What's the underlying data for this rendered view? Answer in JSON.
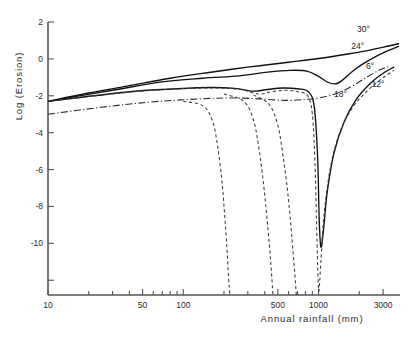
{
  "chart_data": {
    "type": "line",
    "title": "",
    "xlabel": "Annual rainfall (mm)",
    "ylabel": "Log (Erosion)",
    "xscale": "log",
    "yscale": "linear",
    "xlim": [
      10,
      4000
    ],
    "ylim": [
      -12.8,
      2
    ],
    "grid": false,
    "legend_position": "inline-curve-labels",
    "x_ticks_labeled": [
      10,
      50,
      100,
      500,
      1000,
      3000
    ],
    "x_tick_labels": [
      "10",
      "50",
      "100",
      "500",
      "1000",
      "3000"
    ],
    "x_ticks_minor": [
      20,
      30,
      40,
      60,
      70,
      80,
      90,
      200,
      300,
      400,
      600,
      700,
      800,
      900,
      2000
    ],
    "y_ticks_labeled": [
      2,
      0,
      -2,
      -4,
      -6,
      -8,
      -10
    ],
    "y_tick_labels": [
      "2",
      "0",
      "-2",
      "-4",
      "-6",
      "-8",
      "-10"
    ],
    "y_ticks_minor": [
      -12
    ],
    "series": [
      {
        "name": "30",
        "label": "30°",
        "style": "solid",
        "label_x": 2150,
        "label_y": 1.45,
        "points": [
          [
            10,
            -2.3
          ],
          [
            20,
            -1.85
          ],
          [
            40,
            -1.45
          ],
          [
            80,
            -1.05
          ],
          [
            150,
            -0.75
          ],
          [
            300,
            -0.45
          ],
          [
            600,
            -0.18
          ],
          [
            1000,
            0.02
          ],
          [
            1600,
            0.25
          ],
          [
            2400,
            0.48
          ],
          [
            3300,
            0.7
          ],
          [
            3900,
            0.82
          ]
        ]
      },
      {
        "name": "24",
        "label": "24°",
        "style": "solid",
        "label_x": 1950,
        "label_y": 0.55,
        "points": [
          [
            10,
            -2.3
          ],
          [
            30,
            -1.7
          ],
          [
            70,
            -1.25
          ],
          [
            140,
            -1.05
          ],
          [
            260,
            -0.92
          ],
          [
            420,
            -0.72
          ],
          [
            620,
            -0.62
          ],
          [
            820,
            -0.66
          ],
          [
            1000,
            -0.95
          ],
          [
            1180,
            -1.28
          ],
          [
            1350,
            -1.35
          ],
          [
            1500,
            -1.15
          ],
          [
            1750,
            -0.72
          ],
          [
            2100,
            -0.3
          ],
          [
            2600,
            0.1
          ],
          [
            3200,
            0.42
          ],
          [
            3900,
            0.68
          ]
        ]
      },
      {
        "name": "18",
        "label": "18°",
        "style": "solid",
        "label_x": 1450,
        "label_y": -2.05,
        "points": [
          [
            10,
            -2.3
          ],
          [
            40,
            -1.78
          ],
          [
            90,
            -1.62
          ],
          [
            160,
            -1.55
          ],
          [
            240,
            -1.6
          ],
          [
            330,
            -1.75
          ],
          [
            420,
            -1.66
          ],
          [
            540,
            -1.58
          ],
          [
            700,
            -1.62
          ],
          [
            840,
            -1.78
          ],
          [
            930,
            -2.6
          ],
          [
            985,
            -5.4
          ],
          [
            1010,
            -8.6
          ],
          [
            1040,
            -10.2
          ],
          [
            1090,
            -9.2
          ],
          [
            1160,
            -7.2
          ],
          [
            1300,
            -5.1
          ],
          [
            1550,
            -3.4
          ],
          [
            1900,
            -2.2
          ],
          [
            2400,
            -1.35
          ],
          [
            3000,
            -0.78
          ],
          [
            3600,
            -0.45
          ]
        ]
      },
      {
        "name": "12",
        "label": "12°",
        "style": "dashed",
        "label_x": 2750,
        "label_y": -1.55,
        "points": [
          [
            10,
            -2.3
          ],
          [
            40,
            -1.8
          ],
          [
            95,
            -1.62
          ],
          [
            170,
            -1.58
          ],
          [
            260,
            -1.65
          ],
          [
            360,
            -1.9
          ],
          [
            450,
            -1.78
          ],
          [
            570,
            -1.7
          ],
          [
            700,
            -1.78
          ],
          [
            830,
            -2.0
          ],
          [
            900,
            -3.0
          ],
          [
            940,
            -5.6
          ],
          [
            965,
            -8.6
          ],
          [
            985,
            -11.2
          ],
          [
            1005,
            -12.6
          ],
          [
            1040,
            -11.0
          ],
          [
            1100,
            -8.4
          ],
          [
            1230,
            -5.8
          ],
          [
            1450,
            -3.9
          ],
          [
            1800,
            -2.6
          ],
          [
            2300,
            -1.72
          ],
          [
            2900,
            -1.1
          ],
          [
            3600,
            -0.62
          ]
        ]
      },
      {
        "name": "6",
        "label": "6°",
        "style": "dashdot",
        "label_x": 2400,
        "label_y": -0.55,
        "points": [
          [
            10,
            -3.0
          ],
          [
            25,
            -2.62
          ],
          [
            55,
            -2.35
          ],
          [
            110,
            -2.2
          ],
          [
            200,
            -2.12
          ],
          [
            330,
            -2.15
          ],
          [
            470,
            -2.22
          ],
          [
            620,
            -2.25
          ],
          [
            800,
            -2.2
          ],
          [
            1000,
            -2.12
          ],
          [
            1300,
            -1.92
          ],
          [
            1700,
            -1.55
          ],
          [
            2200,
            -1.05
          ],
          [
            2800,
            -0.62
          ],
          [
            3400,
            -0.38
          ]
        ]
      },
      {
        "name": "plunge-left-1",
        "label": "",
        "style": "dashed",
        "label_x": null,
        "label_y": null,
        "points": [
          [
            100,
            -2.3
          ],
          [
            140,
            -2.55
          ],
          [
            165,
            -3.4
          ],
          [
            180,
            -4.8
          ],
          [
            193,
            -6.6
          ],
          [
            202,
            -8.4
          ],
          [
            210,
            -10.2
          ],
          [
            216,
            -11.8
          ],
          [
            221,
            -12.8
          ]
        ]
      },
      {
        "name": "plunge-left-2",
        "label": "",
        "style": "dashed",
        "label_x": null,
        "label_y": null,
        "points": [
          [
            200,
            -1.9
          ],
          [
            280,
            -2.3
          ],
          [
            330,
            -3.3
          ],
          [
            365,
            -5.0
          ],
          [
            395,
            -7.0
          ],
          [
            420,
            -9.0
          ],
          [
            443,
            -11.0
          ],
          [
            460,
            -12.8
          ]
        ]
      },
      {
        "name": "plunge-left-3",
        "label": "",
        "style": "dashed",
        "label_x": null,
        "label_y": null,
        "points": [
          [
            330,
            -1.95
          ],
          [
            430,
            -2.45
          ],
          [
            500,
            -3.6
          ],
          [
            550,
            -5.4
          ],
          [
            595,
            -7.4
          ],
          [
            632,
            -9.5
          ],
          [
            665,
            -11.5
          ],
          [
            685,
            -12.8
          ]
        ]
      }
    ]
  }
}
